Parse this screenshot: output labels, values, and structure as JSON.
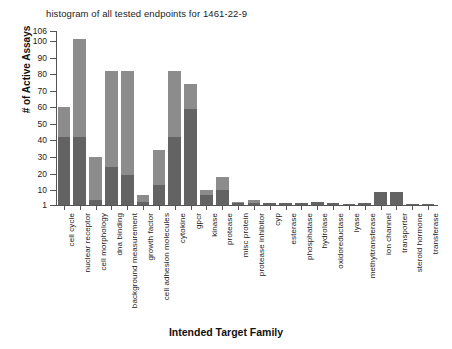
{
  "chart_data": {
    "type": "bar",
    "title": "histogram of all tested endpoints for 1461-22-9",
    "xlabel": "Intended Target Family",
    "ylabel": "# of Active Assays",
    "ylim": [
      1,
      106
    ],
    "yticks": [
      1,
      10,
      20,
      30,
      40,
      50,
      60,
      70,
      80,
      90,
      100,
      106
    ],
    "ytick_labels": [
      "1",
      "10",
      "20",
      "30",
      "40",
      "50",
      "60",
      "70",
      "80",
      "90",
      "100",
      "106"
    ],
    "grid": false,
    "legend": "none",
    "stacked": true,
    "series": [
      {
        "name": "active",
        "color": "#636363"
      },
      {
        "name": "tested",
        "color": "#8c8c8c"
      }
    ],
    "categories": [
      "cell cycle",
      "nuclear receptor",
      "cell morphology",
      "dna binding",
      "background measurement",
      "growth factor",
      "cell adhesion molecules",
      "cytokine",
      "gpcr",
      "kinase",
      "protease",
      "misc protein",
      "protease inhibitor",
      "cyp",
      "esterase",
      "phosphatase",
      "hydrolase",
      "oxidoreductase",
      "lyase",
      "methyltransferase",
      "ion channel",
      "transporter",
      "steroid hormone",
      "transferase"
    ],
    "values": [
      60,
      101,
      30,
      82,
      82,
      7,
      34,
      82,
      74,
      10,
      18,
      3,
      4,
      2,
      2,
      2,
      3,
      2,
      1,
      2,
      9,
      9,
      1,
      1
    ],
    "values_dark": [
      42,
      42,
      4,
      24,
      19,
      3,
      13,
      42,
      59,
      7,
      10,
      2,
      2,
      2,
      2,
      2,
      3,
      2,
      1,
      2,
      9,
      9,
      1,
      1
    ]
  }
}
